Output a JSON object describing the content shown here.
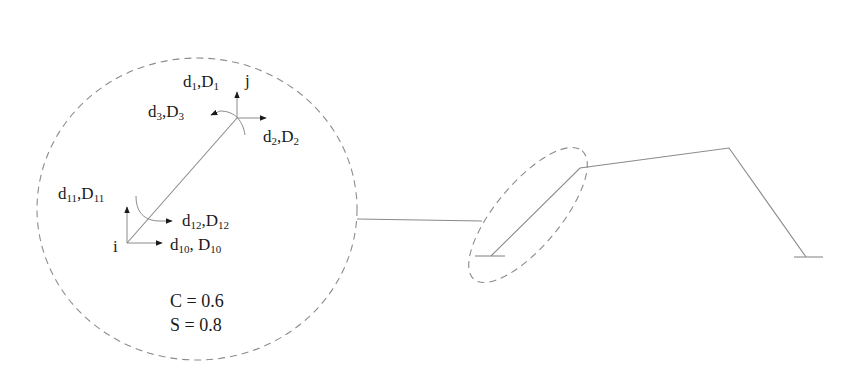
{
  "diagram": {
    "type": "structural-frame-member-detail",
    "colors": {
      "background": "#ffffff",
      "member_line": "#8a8a8a",
      "dashed_outline": "#8c8c8c",
      "arrow": "#1a1a1a",
      "text": "#1a1a1a"
    },
    "detail_circle": {
      "nodes": {
        "start": {
          "label": "i"
        },
        "end": {
          "label": "j"
        }
      },
      "dofs": [
        {
          "id": "d1",
          "base": "d",
          "sub": "1",
          "base2": "D",
          "sub2": "1",
          "node": "j",
          "direction": "up"
        },
        {
          "id": "d2",
          "base": "d",
          "sub": "2",
          "base2": "D",
          "sub2": "2",
          "node": "j",
          "direction": "right"
        },
        {
          "id": "d3",
          "base": "d",
          "sub": "3",
          "base2": "D",
          "sub2": "3",
          "node": "j",
          "direction": "rotation"
        },
        {
          "id": "d10",
          "base": "d",
          "sub": "10",
          "base2": "D",
          "sub2": "10",
          "node": "i",
          "direction": "right",
          "separator": ", "
        },
        {
          "id": "d11",
          "base": "d",
          "sub": "11",
          "base2": "D",
          "sub2": "11",
          "node": "i",
          "direction": "up"
        },
        {
          "id": "d12",
          "base": "d",
          "sub": "12",
          "base2": "D",
          "sub2": "12",
          "node": "i",
          "direction": "rotation"
        }
      ],
      "constants": {
        "cosine": "C = 0.6",
        "sine": "S = 0.8"
      }
    },
    "frame": {
      "description": "Inclined-leg portal frame with two fixed supports; left inclined member highlighted by dashed ellipse and expanded in detail circle",
      "supports": 2,
      "members": 3
    }
  }
}
